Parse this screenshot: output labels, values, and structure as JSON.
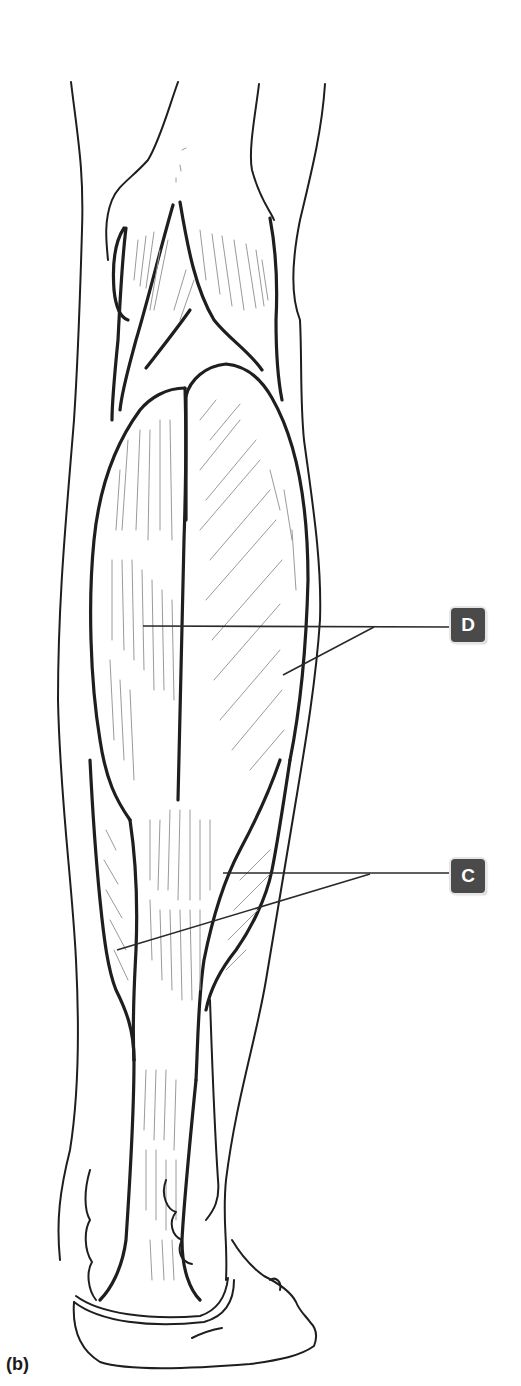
{
  "figure": {
    "panel_letter": "(b)",
    "view": "posterior view of right lower leg (calf muscles)",
    "labels": [
      {
        "id": "D",
        "text": "D",
        "box": {
          "x": 451,
          "y": 608
        },
        "points_to": [
          "medial gastrocnemius head",
          "lateral gastrocnemius head"
        ]
      },
      {
        "id": "C",
        "text": "C",
        "box": {
          "x": 451,
          "y": 859
        },
        "points_to": [
          "soleus (lateral)",
          "soleus (medial)"
        ]
      }
    ],
    "colors": {
      "label_bg": "#4a4a4a",
      "label_text": "#ffffff",
      "line": "#1e1e1e",
      "fiber": "#9a9a9a",
      "background": "#ffffff"
    }
  }
}
